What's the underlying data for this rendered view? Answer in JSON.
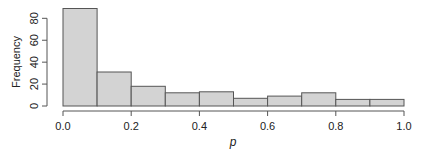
{
  "chart_data": {
    "type": "bar",
    "subtype": "histogram",
    "title": "",
    "xlabel": "p",
    "ylabel": "Frequency",
    "bin_edges": [
      0.0,
      0.1,
      0.2,
      0.3,
      0.4,
      0.5,
      0.6,
      0.7,
      0.8,
      0.9,
      1.0
    ],
    "categories": [
      "0.0-0.1",
      "0.1-0.2",
      "0.2-0.3",
      "0.3-0.4",
      "0.4-0.5",
      "0.5-0.6",
      "0.6-0.7",
      "0.7-0.8",
      "0.8-0.9",
      "0.9-1.0"
    ],
    "values": [
      89,
      31,
      18,
      12,
      13,
      7,
      9,
      12,
      6,
      6
    ],
    "xlim": [
      0.0,
      1.0
    ],
    "ylim": [
      0,
      80
    ],
    "x_ticks": [
      "0.0",
      "0.2",
      "0.4",
      "0.6",
      "0.8",
      "1.0"
    ],
    "y_ticks": [
      "0",
      "20",
      "40",
      "60",
      "80"
    ],
    "grid": false,
    "legend": null,
    "bar_fill": "#d3d3d3",
    "bar_stroke": "#555555"
  }
}
